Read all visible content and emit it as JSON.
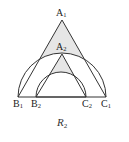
{
  "figure": {
    "caption": {
      "letter": "R",
      "subscript": "2"
    },
    "stroke_color": "#333333",
    "shade_color": "#e6e6e6",
    "points": {
      "A1": {
        "letter": "A",
        "sub": "1",
        "x": 62,
        "y": 20
      },
      "B1": {
        "letter": "B",
        "sub": "1",
        "x": 18,
        "y": 97
      },
      "C1": {
        "letter": "C",
        "sub": "1",
        "x": 106,
        "y": 97
      },
      "A2": {
        "letter": "A",
        "sub": "2",
        "x": 62,
        "y": 54
      },
      "B2": {
        "letter": "B",
        "sub": "2",
        "x": 36,
        "y": 97
      },
      "C2": {
        "letter": "C",
        "sub": "2",
        "x": 86,
        "y": 97
      }
    },
    "arcs": [
      {
        "name": "large-semicircle",
        "cx": 62,
        "cy": 97,
        "r": 44
      },
      {
        "name": "small-semicircle",
        "cx": 61,
        "cy": 97,
        "r": 25
      }
    ]
  }
}
